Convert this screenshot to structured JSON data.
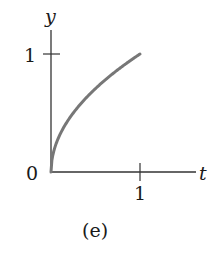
{
  "chart_data": {
    "type": "line",
    "title": "",
    "panel_label": "(e)",
    "xlabel": "t",
    "ylabel": "y",
    "origin_label": "0",
    "x_ticks": [
      {
        "value": 1,
        "label": "1"
      }
    ],
    "y_ticks": [
      {
        "value": 1,
        "label": "1"
      }
    ],
    "xlim": [
      0,
      1.5
    ],
    "ylim": [
      0,
      1.1
    ],
    "grid": false,
    "legend": null,
    "series": [
      {
        "name": "y = sqrt(t)",
        "color": "#777777",
        "x": [
          0,
          0.01,
          0.05,
          0.1,
          0.2,
          0.3,
          0.4,
          0.5,
          0.6,
          0.7,
          0.8,
          0.9,
          1.0
        ],
        "values": [
          0,
          0.1,
          0.224,
          0.316,
          0.447,
          0.548,
          0.632,
          0.707,
          0.775,
          0.837,
          0.894,
          0.949,
          1.0
        ]
      }
    ],
    "axis_color": "#333333"
  }
}
